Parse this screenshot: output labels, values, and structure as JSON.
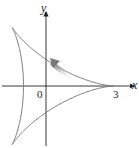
{
  "diagram": {
    "type": "parametric-curve",
    "axes": {
      "x_label": "x",
      "y_label": "y",
      "origin_label": "0",
      "x_tick_label": "3"
    },
    "curve": {
      "cusps": [
        [
          3,
          0
        ],
        [
          -1.5,
          2.598
        ],
        [
          -1.5,
          -2.598
        ]
      ],
      "y_intercepts": [
        1,
        -1
      ],
      "color": "#7a7a7a"
    },
    "arrow": {
      "direction": "counterclockwise",
      "position": "upper branch near y-axis",
      "color": "#8a8a8a"
    },
    "colors": {
      "axis": "#222222",
      "curve": "#7a7a7a",
      "arrow": "#999999"
    }
  }
}
